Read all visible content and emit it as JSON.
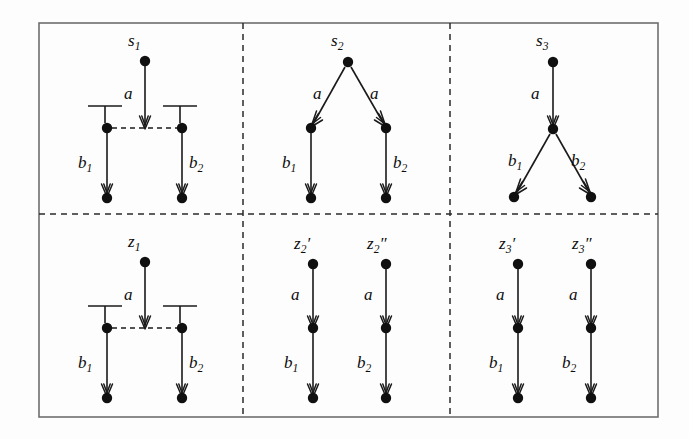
{
  "figure": {
    "background_color": "#fdfdfd",
    "ink_color": "#101010",
    "frame_color": "#6e6e6e",
    "frame": {
      "x": 39,
      "y": 23,
      "width": 619,
      "height": 394
    },
    "dividers": {
      "vertical_x": [
        243,
        450
      ],
      "horizontal_y": [
        214
      ]
    }
  },
  "panels": [
    {
      "id": "panel-s1",
      "row": 0,
      "col": 0,
      "kind": "dashed-conflict",
      "root_label": "s",
      "root_sub": "1",
      "root_prime": "",
      "nodes": [
        {
          "name": "root",
          "x": 145,
          "y": 61
        },
        {
          "name": "left",
          "x": 107,
          "y": 128
        },
        {
          "name": "right",
          "x": 182,
          "y": 128
        },
        {
          "name": "left-leaf",
          "x": 107,
          "y": 196
        },
        {
          "name": "right-leaf",
          "x": 182,
          "y": 196
        }
      ],
      "edges": [
        {
          "from": "root",
          "to": "mid-point",
          "label": "a",
          "sub": ""
        },
        {
          "from": "left",
          "to": "left-leaf",
          "label": "b",
          "sub": "1"
        },
        {
          "from": "right",
          "to": "right-leaf",
          "label": "b",
          "sub": "2"
        }
      ],
      "labels": {
        "a": "a",
        "b1": "b",
        "b1_sub": "1",
        "b2": "b",
        "b2_sub": "2"
      }
    },
    {
      "id": "panel-s2",
      "row": 0,
      "col": 1,
      "kind": "branching-down",
      "root_label": "s",
      "root_sub": "2",
      "root_prime": "",
      "nodes": [
        {
          "name": "root",
          "x": 348,
          "y": 62
        },
        {
          "name": "left",
          "x": 311,
          "y": 128
        },
        {
          "name": "right",
          "x": 386,
          "y": 128
        },
        {
          "name": "left-leaf",
          "x": 311,
          "y": 196
        },
        {
          "name": "right-leaf",
          "x": 386,
          "y": 196
        }
      ],
      "labels": {
        "a_left": "a",
        "a_right": "a",
        "b1": "b",
        "b1_sub": "1",
        "b2": "b",
        "b2_sub": "2"
      }
    },
    {
      "id": "panel-s3",
      "row": 0,
      "col": 2,
      "kind": "late-branching",
      "root_label": "s",
      "root_sub": "3",
      "root_prime": "",
      "nodes": [
        {
          "name": "root",
          "x": 553,
          "y": 62
        },
        {
          "name": "mid",
          "x": 553,
          "y": 129
        },
        {
          "name": "left-leaf",
          "x": 514,
          "y": 196
        },
        {
          "name": "right-leaf",
          "x": 591,
          "y": 196
        }
      ],
      "labels": {
        "a": "a",
        "b1": "b",
        "b1_sub": "1",
        "b2": "b",
        "b2_sub": "2"
      }
    },
    {
      "id": "panel-z1",
      "row": 1,
      "col": 0,
      "kind": "dashed-conflict",
      "root_label": "z",
      "root_sub": "1",
      "root_prime": "",
      "nodes": [
        {
          "name": "root",
          "x": 145,
          "y": 262
        },
        {
          "name": "left",
          "x": 107,
          "y": 328
        },
        {
          "name": "right",
          "x": 182,
          "y": 328
        },
        {
          "name": "left-leaf",
          "x": 107,
          "y": 396
        },
        {
          "name": "right-leaf",
          "x": 182,
          "y": 396
        }
      ],
      "labels": {
        "a": "a",
        "b1": "b",
        "b1_sub": "1",
        "b2": "b",
        "b2_sub": "2"
      }
    },
    {
      "id": "panel-z2",
      "row": 1,
      "col": 1,
      "kind": "two-chains",
      "chains": [
        {
          "root_label": "z",
          "root_sub": "2",
          "root_prime": "′",
          "x": 313,
          "nodes_y": [
            264,
            328,
            396
          ],
          "edge_labels": {
            "top": "a",
            "bottom": "b",
            "bottom_sub": "1"
          }
        },
        {
          "root_label": "z",
          "root_sub": "2",
          "root_prime": "″",
          "x": 386,
          "nodes_y": [
            264,
            328,
            396
          ],
          "edge_labels": {
            "top": "a",
            "bottom": "b",
            "bottom_sub": "2"
          }
        }
      ]
    },
    {
      "id": "panel-z3",
      "row": 1,
      "col": 2,
      "kind": "two-chains",
      "chains": [
        {
          "root_label": "z",
          "root_sub": "3",
          "root_prime": "′",
          "x": 518,
          "nodes_y": [
            264,
            328,
            396
          ],
          "edge_labels": {
            "top": "a",
            "bottom": "b",
            "bottom_sub": "1"
          }
        },
        {
          "root_label": "z",
          "root_sub": "3",
          "root_prime": "″",
          "x": 591,
          "nodes_y": [
            264,
            328,
            396
          ],
          "edge_labels": {
            "top": "a",
            "bottom": "b",
            "bottom_sub": "2"
          }
        }
      ]
    }
  ],
  "text_labels": {
    "s1": "s",
    "s1_sub": "1",
    "s2": "s",
    "s2_sub": "2",
    "s3": "s",
    "s3_sub": "3",
    "z1": "z",
    "z1_sub": "1",
    "z2p": "z",
    "z2p_sub": "2",
    "z2p_prime": "′",
    "z2pp": "z",
    "z2pp_sub": "2",
    "z2pp_prime": "″",
    "z3p": "z",
    "z3p_sub": "3",
    "z3p_prime": "′",
    "z3pp": "z",
    "z3pp_sub": "3",
    "z3pp_prime": "″",
    "a": "a",
    "b": "b",
    "sub1": "1",
    "sub2": "2"
  }
}
